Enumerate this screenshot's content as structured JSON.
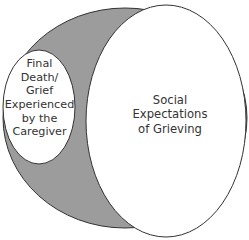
{
  "diagram": {
    "type": "nested-ellipses",
    "colors": {
      "shaded_region": "#9c9c9c",
      "outline": "#333333",
      "background": "#ffffff"
    },
    "regions": {
      "outer_shaded": {
        "label": ""
      },
      "small_ellipse": {
        "lines": [
          "Final",
          "Death/",
          "Grief",
          "Experienced",
          "by the",
          "Caregiver"
        ]
      },
      "large_ellipse": {
        "lines": [
          "Social",
          "Expectations",
          "of Grieving"
        ]
      }
    }
  }
}
